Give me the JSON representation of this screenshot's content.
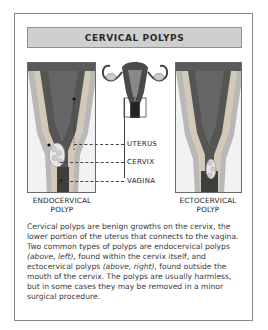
{
  "title": "CERVICAL POLYPS",
  "labels": {
    "uterus": "UTERUS",
    "cervix": "CERVIX",
    "vagina": "VAGINA"
  },
  "captions": {
    "left_line1": "ENDOCERVICAL",
    "left_line2": "POLYP",
    "right_line1": "ECTOCERVICAL",
    "right_line2": "POLYP"
  },
  "body": {
    "p1": "Cervical polyps are benign growths on the cervix, the lower portion of the uterus that connects to the vagina. Two common types of polyps are endocervical polyps ",
    "em1": "(above, left),",
    "p2": " found within the cervix itself, and ectocervical polyps ",
    "em2": "(above, right),",
    "p3": " found outside the mouth of the cervix. The polyps are usually harmless, but in some cases they may be removed in a minor surgical procedure."
  },
  "colors": {
    "title_bg": "#cfcfcf",
    "border": "#8a8a8a",
    "tissue_dark": "#4a4a4a",
    "tissue_light": "#b5b5b5"
  }
}
